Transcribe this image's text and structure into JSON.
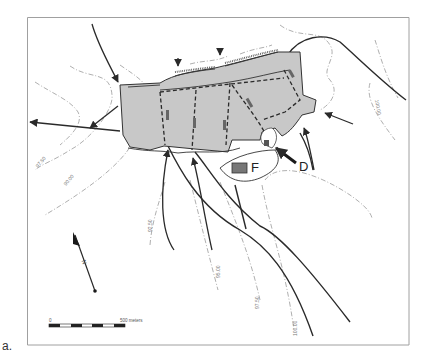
{
  "figure": {
    "panel_label": "a.",
    "type": "site plan / topographic map",
    "frame_color": "#999999",
    "fill_area_color": "#c8c8c8"
  },
  "labels": {
    "feature_d": "D",
    "feature_f": "F"
  },
  "contours": [
    {
      "label": "97.50",
      "position": "left"
    },
    {
      "label": "90.00",
      "position": "left-lower"
    },
    {
      "label": "92.50",
      "position": "bottom-center-left"
    },
    {
      "label": "95.00",
      "position": "bottom-center"
    },
    {
      "label": "97.50",
      "position": "bottom-center-right"
    },
    {
      "label": "100.00",
      "position": "bottom-right"
    },
    {
      "label": "100.00",
      "position": "right"
    }
  ],
  "north_arrow": {
    "label": "N"
  },
  "scale_bar": {
    "start_label": "0",
    "end_label": "500 meters"
  },
  "colors": {
    "shaded_area": "#c8c8c8",
    "lines": "#2a2a2a",
    "contours": "#9a9a9a",
    "frame": "#999999"
  }
}
